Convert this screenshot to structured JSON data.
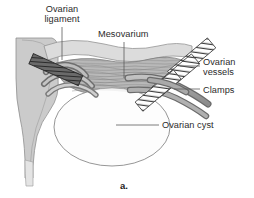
{
  "figure": {
    "caption": "a.",
    "background_color": "#ffffff",
    "text_color": "#2b2b2b",
    "line_color": "#555555"
  },
  "labels": [
    {
      "id": "ovarian-ligament",
      "text": "Ovarian\nligament",
      "line1": "Ovarian",
      "line2": "ligament",
      "leader": "vertical-down"
    },
    {
      "id": "mesovarium",
      "text": "Mesovarium",
      "leader": "vertical-down"
    },
    {
      "id": "ovarian-vessels",
      "text": "Ovarian\nvessels",
      "line1": "Ovarian",
      "line2": "vessels",
      "leader": "horizontal-left"
    },
    {
      "id": "clamps",
      "text": "Clamps",
      "leader": "horizontal-left"
    },
    {
      "id": "ovarian-cyst",
      "text": "Ovarian cyst",
      "leader": "horizontal-left"
    }
  ],
  "structures": {
    "uterus": {
      "name": "uterus",
      "fill": "#c9c9c9",
      "stroke": "#8a8a8a"
    },
    "broad_ligament": {
      "name": "broad-ligament",
      "fill": "#d8d8d8",
      "stroke": "#8a8a8a"
    },
    "mesovarium": {
      "name": "mesovarium",
      "fill": "#b4b4b4",
      "stroke": "#7a7a7a",
      "texture": "wavy-striations"
    },
    "ovarian_cyst": {
      "name": "ovarian-cyst",
      "fill": "#fdfdfd",
      "stroke": "#888888"
    },
    "ovarian_vessels": {
      "name": "ovarian-vessels",
      "fill": "#a8a8a8",
      "stroke": "#6f6f6f"
    },
    "clamps": {
      "name": "surgical-clamps",
      "fill": "#ffffff",
      "stroke": "#3a3a3a",
      "texture": "diagonal-hatch",
      "count": 3
    }
  }
}
